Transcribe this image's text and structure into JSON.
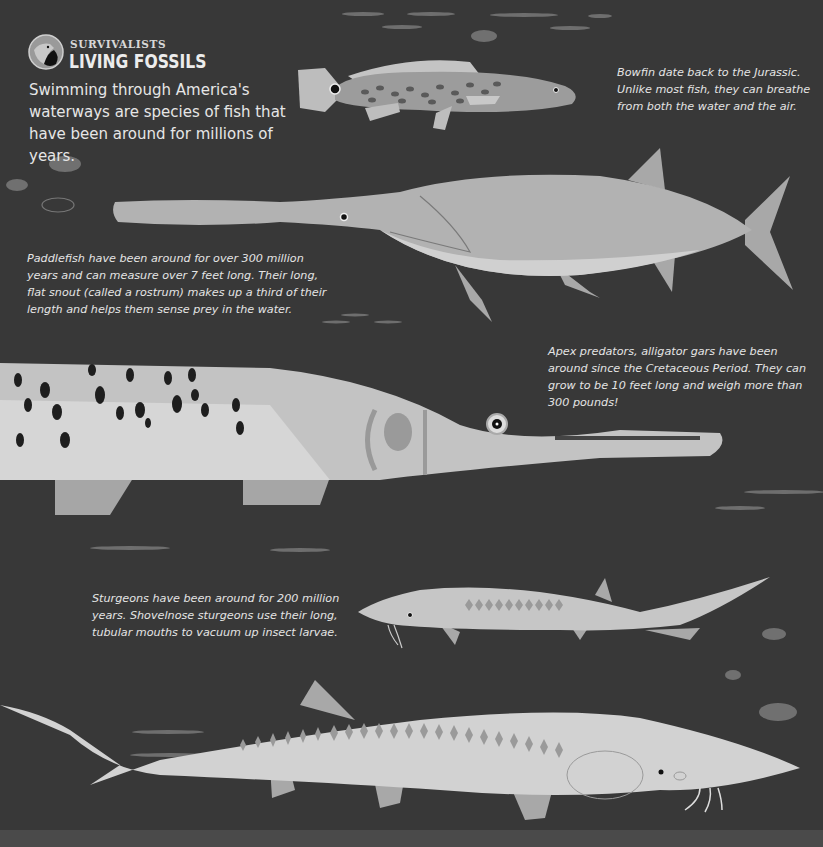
{
  "header": {
    "kicker": "SURVIVALISTS",
    "title": "LIVING FOSSILS",
    "badge_icon": "condor-head-icon"
  },
  "intro": "Swimming through America's waterways are species of fish that have been around for millions of years.",
  "captions": {
    "bowfin": "Bowfin date back to the Jurassic. Unlike most fish, they can breathe from both the water and the air.",
    "paddlefish": "Paddlefish have been around for over 300 million years and can measure over 7 feet long. Their long, flat snout (called a rostrum) makes up a third of their length and helps them sense prey in the water.",
    "alligator_gar": "Apex predators, alligator gars have been around since the Cretaceous Period. They can grow to be 10 feet long and weigh more than 300 pounds!",
    "sturgeon": "Sturgeons have been around for 200 million years. Shovelnose sturgeons use their long, tubular mouths to vacuum up insect larvae."
  },
  "illustrations": [
    "bowfin",
    "paddlefish",
    "alligator-gar",
    "shovelnose-sturgeon",
    "sturgeon"
  ],
  "colors": {
    "background": "#383838",
    "fish_light": "#cfcfcf",
    "fish_mid": "#a6a6a6",
    "text": "#e6e6e6"
  }
}
